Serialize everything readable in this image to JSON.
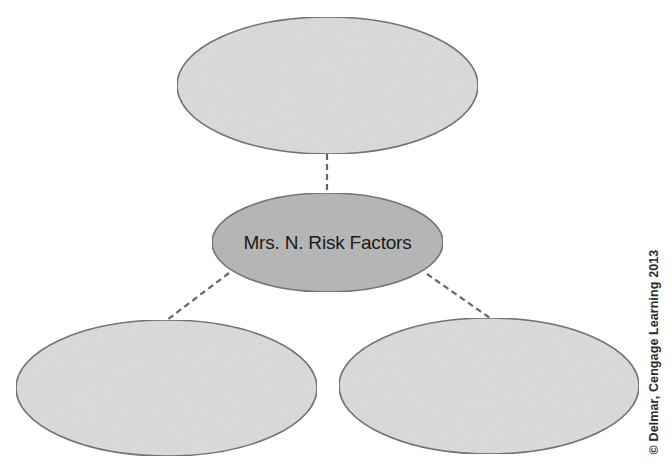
{
  "diagram": {
    "type": "concept-map",
    "center_node": {
      "label": "Mrs. N. Risk Factors",
      "fill": "#b5b5b5"
    },
    "branch_nodes": [
      {
        "position": "top",
        "label": "",
        "fill": "#dadada"
      },
      {
        "position": "bottom-left",
        "label": "",
        "fill": "#dadada"
      },
      {
        "position": "bottom-right",
        "label": "",
        "fill": "#dadada"
      }
    ],
    "connector_style": "dashed",
    "colors": {
      "outline": "#6e6e6e",
      "connector": "#666666",
      "text": "#1a1a1a",
      "background": "#ffffff"
    }
  },
  "credit": {
    "text": "© Delmar, Cengage Learning 2013"
  }
}
